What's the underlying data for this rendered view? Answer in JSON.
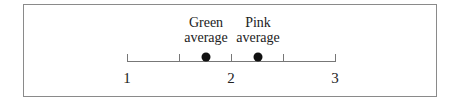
{
  "chart_data": {
    "type": "scatter",
    "title": "",
    "xlabel": "",
    "ylabel": "",
    "xlim": [
      1,
      3
    ],
    "ticks": [
      1,
      1.5,
      2,
      2.5,
      3
    ],
    "tick_labels": [
      "1",
      "",
      "2",
      "",
      "3"
    ],
    "grid": false,
    "points": [
      {
        "name": "Green average",
        "line1": "Green",
        "line2": "average",
        "x": 1.76
      },
      {
        "name": "Pink average",
        "line1": "Pink",
        "line2": "average",
        "x": 2.26
      }
    ]
  },
  "layout": {
    "x_min_px": 127,
    "x_max_px": 335
  }
}
